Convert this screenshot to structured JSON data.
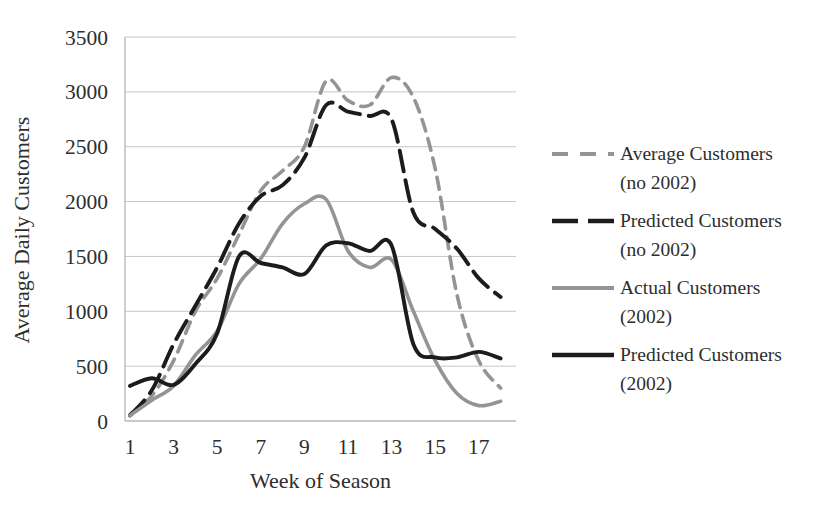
{
  "chart_data": {
    "type": "line",
    "title": "",
    "xlabel": "Week of Season",
    "ylabel": "Average Daily Customers",
    "x": [
      1,
      2,
      3,
      4,
      5,
      6,
      7,
      8,
      9,
      10,
      11,
      12,
      13,
      14,
      15,
      16,
      17,
      18
    ],
    "xtick_labels": [
      "1",
      "3",
      "5",
      "7",
      "9",
      "11",
      "13",
      "15",
      "17"
    ],
    "xtick_values": [
      1,
      3,
      5,
      7,
      9,
      11,
      13,
      15,
      17
    ],
    "ytick_labels": [
      "0",
      "500",
      "1000",
      "1500",
      "2000",
      "2500",
      "3000",
      "3500"
    ],
    "ytick_values": [
      0,
      500,
      1000,
      1500,
      2000,
      2500,
      3000,
      3500
    ],
    "ylim": [
      0,
      3500
    ],
    "grid": "horizontal",
    "legend_position": "right-outside",
    "series": [
      {
        "name": "Average Customers (no 2002)",
        "legend_lines": [
          "Average Customers",
          "(no 2002)"
        ],
        "color": "#949494",
        "line_style": "dashed",
        "values": [
          60,
          230,
          550,
          1000,
          1300,
          1700,
          2100,
          2280,
          2500,
          3100,
          2920,
          2880,
          3130,
          2950,
          2300,
          1150,
          550,
          300
        ]
      },
      {
        "name": "Predicted Customers (no 2002)",
        "legend_lines": [
          "Predicted Customers",
          "(no 2002)"
        ],
        "color": "#1c1c1c",
        "line_style": "long-dashed",
        "values": [
          50,
          280,
          700,
          1050,
          1400,
          1800,
          2050,
          2150,
          2400,
          2880,
          2820,
          2780,
          2750,
          1900,
          1750,
          1570,
          1300,
          1130
        ]
      },
      {
        "name": "Actual Customers (2002)",
        "legend_lines": [
          "Actual Customers",
          "(2002)"
        ],
        "color": "#949494",
        "line_style": "solid",
        "values": [
          50,
          190,
          320,
          600,
          820,
          1250,
          1480,
          1800,
          1980,
          2020,
          1550,
          1400,
          1470,
          1000,
          550,
          250,
          140,
          180
        ]
      },
      {
        "name": "Predicted Customers (2002)",
        "legend_lines": [
          "Predicted Customers",
          "(2002)"
        ],
        "color": "#1c1c1c",
        "line_style": "solid",
        "values": [
          320,
          390,
          330,
          520,
          800,
          1500,
          1440,
          1400,
          1340,
          1600,
          1620,
          1550,
          1600,
          700,
          580,
          580,
          630,
          570
        ]
      }
    ]
  },
  "style": {
    "grid_color": "#c6c6c6",
    "axis_color": "#b0b0b0",
    "text_color": "#2e2e2e",
    "background": "#ffffff"
  }
}
